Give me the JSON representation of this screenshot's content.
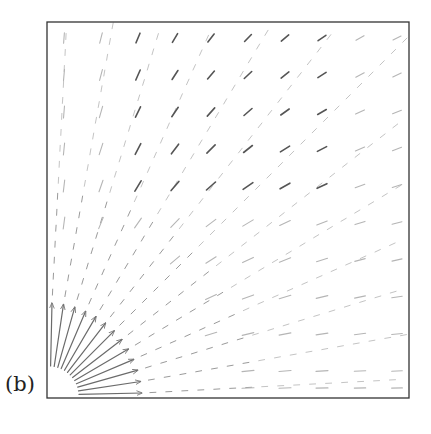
{
  "figure": {
    "panel_label": "(b)"
  },
  "chart_data": {
    "type": "quiver",
    "title": "",
    "xlabel": "",
    "ylabel": "",
    "panel_label": "(b)",
    "axes_box_px": {
      "left": 47,
      "top": 22,
      "right": 409,
      "bottom": 398
    },
    "origin_px": [
      47,
      398
    ],
    "grid": false,
    "rays_deg": [
      3,
      10,
      17,
      24,
      31,
      38,
      45,
      52,
      59,
      66,
      73,
      80,
      87
    ],
    "near_field": {
      "r_start": 30,
      "r_end": 95,
      "color": "#6b6b6b"
    },
    "far_field_rows_y": [
      38,
      75,
      112,
      149,
      186,
      223,
      260,
      297,
      334,
      371,
      388
    ],
    "far_field_cols_x": [
      64,
      101,
      138,
      175,
      211,
      248,
      285,
      322,
      360,
      397
    ],
    "colors": {
      "dark": "#555555",
      "light": "#b5b5b5",
      "frame": "#333333"
    }
  }
}
